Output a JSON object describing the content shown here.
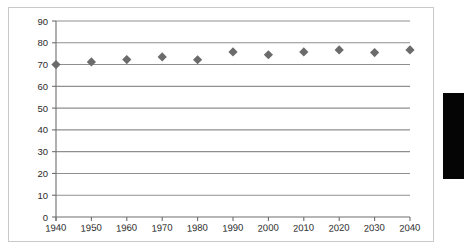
{
  "figure": {
    "background_color": "#ffffff",
    "frame_color": "#c9c9c9",
    "marker_color": "#6b6b6b",
    "gridline_color": "#8f8f8f",
    "axis_color": "#6e6e6e",
    "tick_text_color": "#2b2b2b",
    "edge_tab_color": "#050505",
    "edge_tab_name": "page-edge-black-tab"
  },
  "chart_data": {
    "type": "scatter",
    "title": "",
    "subtitle": "",
    "xlabel": "",
    "ylabel": "",
    "categories": [
      "1940",
      "1950",
      "1960",
      "1970",
      "1980",
      "1990",
      "2000",
      "2010",
      "2020",
      "2030",
      "2040"
    ],
    "x": [
      1940,
      1950,
      1960,
      1970,
      1980,
      1990,
      2000,
      2010,
      2020,
      2030,
      2040
    ],
    "values": [
      70.0,
      71.2,
      72.3,
      73.5,
      72.2,
      75.8,
      74.5,
      75.8,
      76.7,
      75.5,
      76.7
    ],
    "series": [
      {
        "name": "",
        "marker": "diamond",
        "color": "#6b6b6b",
        "values": [
          70.0,
          71.2,
          72.3,
          73.5,
          72.2,
          75.8,
          74.5,
          75.8,
          76.7,
          75.5,
          76.7
        ]
      }
    ],
    "ylim": [
      0,
      90
    ],
    "xlim": [
      1940,
      2040
    ],
    "ytick_labels": [
      "0",
      "10",
      "20",
      "30",
      "40",
      "50",
      "60",
      "70",
      "80",
      "90"
    ],
    "yticks": [
      0,
      10,
      20,
      30,
      40,
      50,
      60,
      70,
      80,
      90
    ],
    "xtick_labels": [
      "1940",
      "1950",
      "1960",
      "1970",
      "1980",
      "1990",
      "2000",
      "2010",
      "2020",
      "2030",
      "2040"
    ],
    "xticks": [
      1940,
      1950,
      1960,
      1970,
      1980,
      1990,
      2000,
      2010,
      2020,
      2030,
      2040
    ],
    "grid": "horizontal",
    "grid_on": true,
    "legend": "none",
    "legend_position": "none",
    "annotations": []
  }
}
